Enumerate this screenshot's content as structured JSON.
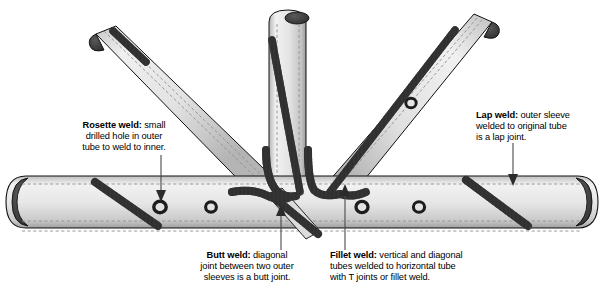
{
  "figure": {
    "kind": "technical-illustration",
    "background_color": "#ffffff",
    "line_color": "#000000",
    "tube_fill_light": "#ececec",
    "tube_fill_mid": "#d6d6d6",
    "tube_fill_dark": "#8a8a8a",
    "tube_cap_dark": "#3b3b3b",
    "weld_bead_color": "#4f4f4f",
    "hidden_line_color": "#8f8f8f"
  },
  "callouts": [
    {
      "id": "rosette-weld",
      "term": "Rosette weld:",
      "text": " small drilled hole in outer tube to weld to inner.",
      "line1": "Rosette weld: small",
      "line2": "drilled hole in outer",
      "line3": "tube to weld to inner.",
      "arrow_direction": "down"
    },
    {
      "id": "lap-weld",
      "term": "Lap weld:",
      "text": " outer sleeve welded to original tube is a lap joint.",
      "line1": "Lap weld: outer sleeve",
      "line2": "welded to original tube",
      "line3": "is a lap joint.",
      "arrow_direction": "down"
    },
    {
      "id": "butt-weld",
      "term": "Butt weld:",
      "text": " diagonal joint between two outer sleeves is a butt joint.",
      "line1": "Butt weld: diagonal",
      "line2": "joint between two outer",
      "line3": "sleeves is a butt joint.",
      "arrow_direction": "up"
    },
    {
      "id": "fillet-weld",
      "term": "Fillet weld:",
      "text": " vertical and diagonal tubes welded to horizontal tube with T joints or fillet weld.",
      "line1": "Fillet weld: vertical and diagonal",
      "line2": "tubes welded to horizontal tube",
      "line3": "with T joints or fillet weld.",
      "arrow_direction": "up"
    }
  ],
  "parts": [
    {
      "id": "horizontal-tube",
      "label": "horizontal tube"
    },
    {
      "id": "vertical-tube",
      "label": "vertical tube"
    },
    {
      "id": "left-diagonal-tube",
      "label": "left diagonal tube"
    },
    {
      "id": "right-diagonal-tube",
      "label": "right diagonal tube"
    },
    {
      "id": "lower-diagonal-tube",
      "label": "lower diagonal tube"
    }
  ]
}
